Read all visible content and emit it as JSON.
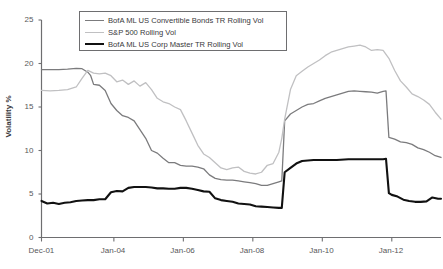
{
  "chart_data": {
    "type": "line",
    "title": "",
    "xlabel": "",
    "ylabel": "Volatility %",
    "ylim": [
      0,
      25
    ],
    "yticks": [
      0,
      5,
      10,
      15,
      20,
      25
    ],
    "ytick_labels": [
      "0",
      "5",
      "10",
      "15",
      "20",
      "25"
    ],
    "xtick_labels": [
      "Dec-01",
      "Jan-04",
      "Jan-06",
      "Jan-08",
      "Jan-10",
      "Jan-12"
    ],
    "xtick_values": [
      "2001-12",
      "2004-01",
      "2006-01",
      "2008-01",
      "2010-01",
      "2012-01"
    ],
    "xlim": [
      "2001-12",
      "2013-06"
    ],
    "grid": false,
    "legend_position": "top-left-inside",
    "legend_entries": [
      "BofA ML US Convertible Bonds TR Rolling Vol",
      "S&P 500 Rolling Vol",
      "BofA ML US Corp Master TR Rolling Vol"
    ],
    "series": [
      {
        "name": "BofA ML US Convertible Bonds TR Rolling Vol",
        "color": "#7b7b7d",
        "width": 1.3,
        "x": [
          "2001-12",
          "2002-03",
          "2002-06",
          "2002-09",
          "2002-12",
          "2003-02",
          "2003-04",
          "2003-05",
          "2003-06",
          "2003-08",
          "2003-10",
          "2003-12",
          "2004-02",
          "2004-04",
          "2004-06",
          "2004-08",
          "2004-10",
          "2004-12",
          "2005-02",
          "2005-04",
          "2005-06",
          "2005-08",
          "2005-10",
          "2005-12",
          "2006-02",
          "2006-04",
          "2006-06",
          "2006-08",
          "2006-10",
          "2006-12",
          "2007-02",
          "2007-04",
          "2007-06",
          "2007-08",
          "2007-10",
          "2007-12",
          "2008-02",
          "2008-04",
          "2008-06",
          "2008-08",
          "2008-10",
          "2008-11",
          "2008-12",
          "2009-02",
          "2009-04",
          "2009-06",
          "2009-08",
          "2009-10",
          "2009-12",
          "2010-02",
          "2010-04",
          "2010-06",
          "2010-08",
          "2010-10",
          "2010-12",
          "2011-02",
          "2011-04",
          "2011-06",
          "2011-08",
          "2011-10",
          "2011-11",
          "2011-12",
          "2012-02",
          "2012-04",
          "2012-06",
          "2012-08",
          "2012-10",
          "2012-12",
          "2013-02",
          "2013-04",
          "2013-06"
        ],
        "y": [
          19.3,
          19.3,
          19.3,
          19.35,
          19.45,
          19.4,
          19.0,
          18.6,
          17.6,
          17.5,
          16.9,
          15.4,
          14.6,
          14.0,
          13.8,
          13.4,
          12.4,
          11.4,
          10.0,
          9.7,
          9.1,
          8.6,
          8.6,
          8.3,
          8.2,
          8.2,
          8.1,
          7.9,
          7.2,
          6.8,
          6.65,
          6.6,
          6.6,
          6.5,
          6.4,
          6.3,
          6.2,
          6.0,
          6.0,
          6.2,
          6.4,
          6.5,
          13.4,
          14.2,
          14.6,
          15.0,
          15.3,
          15.4,
          15.7,
          16.0,
          16.2,
          16.4,
          16.6,
          16.8,
          16.85,
          16.8,
          16.75,
          16.7,
          16.6,
          16.8,
          16.85,
          11.5,
          11.3,
          11.0,
          10.9,
          10.7,
          10.3,
          10.1,
          9.8,
          9.4,
          9.2
        ]
      },
      {
        "name": "S&P 500 Rolling Vol",
        "color": "#c0c0c2",
        "width": 1.3,
        "x": [
          "2001-12",
          "2002-03",
          "2002-06",
          "2002-09",
          "2002-12",
          "2003-02",
          "2003-04",
          "2003-06",
          "2003-08",
          "2003-10",
          "2003-12",
          "2004-02",
          "2004-04",
          "2004-06",
          "2004-08",
          "2004-10",
          "2004-12",
          "2005-02",
          "2005-04",
          "2005-06",
          "2005-08",
          "2005-10",
          "2005-12",
          "2006-02",
          "2006-04",
          "2006-06",
          "2006-08",
          "2006-10",
          "2006-12",
          "2007-02",
          "2007-04",
          "2007-06",
          "2007-08",
          "2007-10",
          "2007-12",
          "2008-02",
          "2008-04",
          "2008-06",
          "2008-08",
          "2008-10",
          "2008-11",
          "2008-12",
          "2009-02",
          "2009-04",
          "2009-06",
          "2009-08",
          "2009-10",
          "2009-12",
          "2010-02",
          "2010-04",
          "2010-06",
          "2010-08",
          "2010-10",
          "2010-12",
          "2011-02",
          "2011-04",
          "2011-06",
          "2011-08",
          "2011-10",
          "2011-12",
          "2012-02",
          "2012-04",
          "2012-06",
          "2012-08",
          "2012-10",
          "2012-12",
          "2013-02",
          "2013-04",
          "2013-06"
        ],
        "y": [
          16.9,
          16.85,
          16.9,
          17.0,
          17.3,
          18.3,
          19.2,
          18.9,
          18.8,
          18.9,
          18.6,
          17.9,
          18.1,
          17.6,
          18.0,
          17.4,
          17.8,
          17.0,
          16.0,
          15.6,
          15.4,
          15.0,
          14.7,
          13.4,
          12.0,
          10.6,
          9.6,
          9.2,
          8.6,
          8.0,
          7.8,
          8.0,
          8.1,
          7.6,
          7.4,
          7.3,
          7.5,
          8.3,
          8.5,
          9.8,
          11.4,
          13.6,
          17.0,
          18.6,
          19.1,
          19.6,
          20.0,
          20.4,
          20.9,
          21.3,
          21.5,
          21.7,
          21.9,
          22.0,
          22.1,
          21.9,
          21.5,
          21.6,
          21.5,
          20.6,
          19.2,
          18.0,
          17.3,
          16.5,
          16.2,
          15.8,
          15.3,
          14.4,
          13.6
        ]
      },
      {
        "name": "BofA ML US Corp Master TR Rolling Vol",
        "color": "#111111",
        "width": 2.1,
        "x": [
          "2001-12",
          "2002-02",
          "2002-04",
          "2002-06",
          "2002-08",
          "2002-10",
          "2002-12",
          "2003-02",
          "2003-04",
          "2003-06",
          "2003-08",
          "2003-10",
          "2003-12",
          "2004-02",
          "2004-04",
          "2004-06",
          "2004-08",
          "2004-10",
          "2004-12",
          "2005-02",
          "2005-04",
          "2005-06",
          "2005-08",
          "2005-10",
          "2005-12",
          "2006-02",
          "2006-04",
          "2006-06",
          "2006-08",
          "2006-10",
          "2006-12",
          "2007-02",
          "2007-04",
          "2007-06",
          "2007-08",
          "2007-10",
          "2007-12",
          "2008-02",
          "2008-04",
          "2008-06",
          "2008-08",
          "2008-10",
          "2008-11",
          "2008-12",
          "2009-02",
          "2009-04",
          "2009-06",
          "2009-08",
          "2009-10",
          "2009-12",
          "2010-02",
          "2010-06",
          "2010-10",
          "2011-02",
          "2011-06",
          "2011-08",
          "2011-10",
          "2011-11",
          "2011-12",
          "2012-01",
          "2012-03",
          "2012-05",
          "2012-07",
          "2012-09",
          "2012-11",
          "2013-01",
          "2013-03",
          "2013-05",
          "2013-06"
        ],
        "y": [
          4.2,
          3.9,
          4.0,
          3.85,
          4.0,
          4.05,
          4.2,
          4.25,
          4.3,
          4.3,
          4.4,
          4.4,
          5.2,
          5.35,
          5.3,
          5.7,
          5.8,
          5.8,
          5.8,
          5.75,
          5.65,
          5.65,
          5.6,
          5.6,
          5.7,
          5.7,
          5.6,
          5.45,
          5.3,
          5.25,
          4.5,
          4.3,
          4.2,
          4.1,
          3.9,
          3.85,
          3.8,
          3.6,
          3.55,
          3.5,
          3.45,
          3.4,
          3.4,
          7.5,
          8.0,
          8.5,
          8.8,
          8.85,
          8.9,
          8.9,
          8.9,
          8.9,
          9.0,
          9.0,
          9.0,
          9.0,
          9.0,
          9.05,
          5.1,
          4.9,
          4.7,
          4.35,
          4.2,
          4.1,
          4.1,
          4.15,
          4.6,
          4.45,
          4.45
        ]
      }
    ]
  },
  "axis": {
    "y_title": "Volatility %",
    "y_ticks": [
      "25",
      "20",
      "15",
      "10",
      "5",
      "0"
    ],
    "x_ticks": [
      "Dec-01",
      "Jan-04",
      "Jan-06",
      "Jan-08",
      "Jan-10",
      "Jan-12"
    ]
  },
  "legend": {
    "items": [
      {
        "label": "BofA ML US Convertible Bonds TR Rolling Vol",
        "color": "#7b7b7d",
        "thickness": "1.4px"
      },
      {
        "label": "S&P 500 Rolling Vol",
        "color": "#c0c0c2",
        "thickness": "1.4px"
      },
      {
        "label": "BofA ML US Corp Master TR Rolling Vol",
        "color": "#111111",
        "thickness": "2.4px"
      }
    ]
  },
  "colors": {
    "axis": "#6e6e70",
    "tick_text": "#58585a",
    "background": "#ffffff"
  }
}
